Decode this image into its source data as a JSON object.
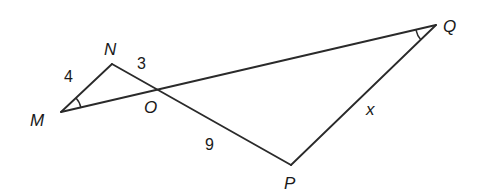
{
  "diagram": {
    "type": "geometry",
    "points": {
      "M": {
        "label": "M",
        "x": 61,
        "y": 112
      },
      "N": {
        "label": "N",
        "x": 112,
        "y": 64
      },
      "O": {
        "label": "O",
        "x": 156,
        "y": 90
      },
      "P": {
        "label": "P",
        "x": 291,
        "y": 165
      },
      "Q": {
        "label": "Q",
        "x": 436,
        "y": 25
      }
    },
    "segments": [
      {
        "from": "M",
        "to": "N",
        "length_label": "4"
      },
      {
        "from": "N",
        "to": "P",
        "via": "O"
      },
      {
        "from": "M",
        "to": "Q",
        "via": "O"
      },
      {
        "from": "Q",
        "to": "P",
        "length_label": "x"
      }
    ],
    "segment_labels": {
      "MN": "4",
      "NO": "3",
      "OP": "9",
      "QP": "x"
    },
    "angle_marks": [
      {
        "vertex": "M",
        "marks": 1
      },
      {
        "vertex": "Q",
        "marks": 1
      }
    ],
    "colors": {
      "line": "#2a2a2a",
      "background": "#ffffff"
    }
  }
}
